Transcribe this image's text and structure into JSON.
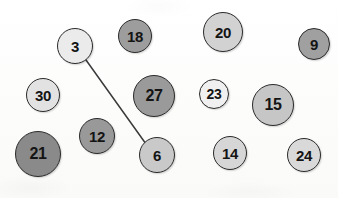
{
  "diagram": {
    "background_color": "#fdfdfc",
    "node_border_color": "#2b2b2b",
    "edge_color": "#3a3a3a",
    "label_color": "#141414",
    "nodes": [
      {
        "id": "n3",
        "label": "3",
        "cx": 75,
        "cy": 46,
        "r": 18,
        "fill": "#ebebeb",
        "font_size": 15
      },
      {
        "id": "n18",
        "label": "18",
        "cx": 135,
        "cy": 36,
        "r": 17,
        "fill": "#9d9d9d",
        "font_size": 15
      },
      {
        "id": "n20",
        "label": "20",
        "cx": 223,
        "cy": 32,
        "r": 20,
        "fill": "#d2d2d2",
        "font_size": 15
      },
      {
        "id": "n9",
        "label": "9",
        "cx": 314,
        "cy": 44,
        "r": 16,
        "fill": "#a0a0a0",
        "font_size": 15
      },
      {
        "id": "n30",
        "label": "30",
        "cx": 43,
        "cy": 95,
        "r": 17,
        "fill": "#e2e2e2",
        "font_size": 15
      },
      {
        "id": "n27",
        "label": "27",
        "cx": 154,
        "cy": 96,
        "r": 21,
        "fill": "#9a9a9a",
        "font_size": 16
      },
      {
        "id": "n23",
        "label": "23",
        "cx": 214,
        "cy": 94,
        "r": 15,
        "fill": "#f0f0f0",
        "font_size": 14
      },
      {
        "id": "n15",
        "label": "15",
        "cx": 273,
        "cy": 105,
        "r": 21,
        "fill": "#c6c6c6",
        "font_size": 16
      },
      {
        "id": "n12",
        "label": "12",
        "cx": 97,
        "cy": 136,
        "r": 18,
        "fill": "#999999",
        "font_size": 15
      },
      {
        "id": "n21",
        "label": "21",
        "cx": 38,
        "cy": 154,
        "r": 23,
        "fill": "#8a8a8a",
        "font_size": 16
      },
      {
        "id": "n6",
        "label": "6",
        "cx": 157,
        "cy": 155,
        "r": 18,
        "fill": "#c9c9c9",
        "font_size": 15
      },
      {
        "id": "n14",
        "label": "14",
        "cx": 230,
        "cy": 153,
        "r": 17,
        "fill": "#d6d6d6",
        "font_size": 15
      },
      {
        "id": "n24",
        "label": "24",
        "cx": 304,
        "cy": 155,
        "r": 17,
        "fill": "#d9d9d9",
        "font_size": 15
      }
    ],
    "edges": [
      {
        "id": "e3-6",
        "from": "3",
        "to": "6",
        "x1": 86,
        "y1": 60,
        "x2": 146,
        "y2": 144,
        "width": 1.5
      }
    ]
  }
}
